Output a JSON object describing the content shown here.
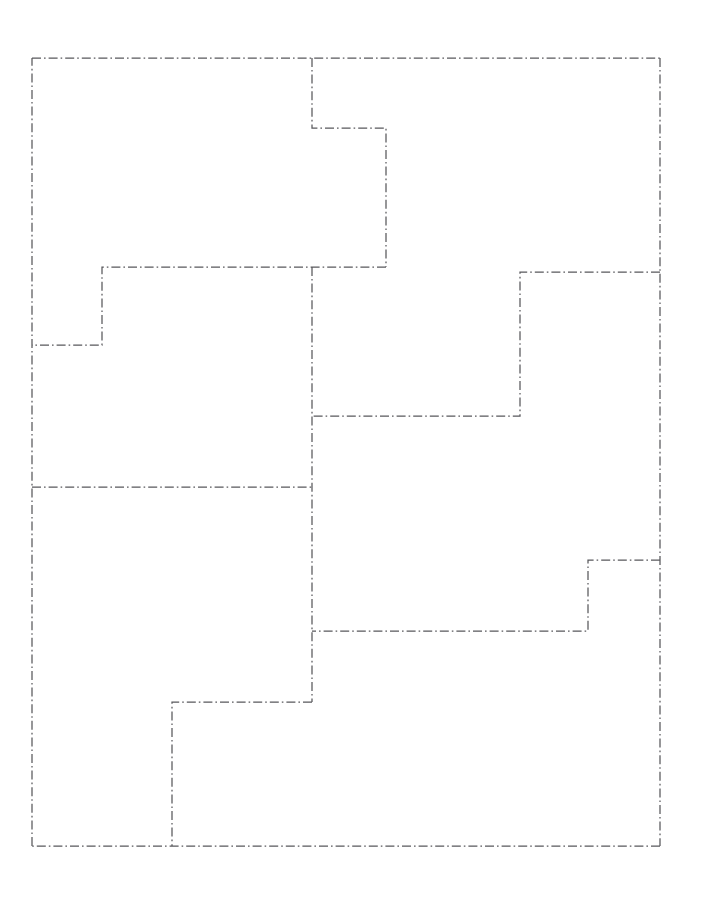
{
  "page": {
    "width": 702,
    "height": 898,
    "background_color": "#ffffff"
  },
  "style": {
    "line_color": "#58585c",
    "line_width": 1.25,
    "line_style": "dash-dot",
    "dash_pattern": "9 3 1.6 3"
  },
  "diagram": {
    "kind": "rectilinear-partition",
    "bounding_box": {
      "x": 32,
      "y": 58,
      "width": 628,
      "height": 788
    },
    "grid_lines_x": [
      32,
      102,
      172,
      312,
      386,
      520,
      588,
      660
    ],
    "grid_lines_y": [
      58,
      128,
      267,
      272,
      345,
      416,
      487,
      560,
      631,
      702,
      846
    ],
    "outline": "M 32 58 L 660 58 L 660 846 L 32 846 Z",
    "segments": [
      {
        "name": "outer-top-edge",
        "path": "M 32 58 L 660 58"
      },
      {
        "name": "outer-right-edge",
        "path": "M 660 58 L 660 846"
      },
      {
        "name": "outer-bottom-edge",
        "path": "M 660 846 L 32 846"
      },
      {
        "name": "outer-left-edge",
        "path": "M 32 846 L 32 58"
      },
      {
        "name": "divider-top-notch",
        "path": "M 312 58 L 312 128 L 386 128 L 386 267"
      },
      {
        "name": "divider-upper-left-step",
        "path": "M 386 267 L 102 267 L 102 345 L 32 345"
      },
      {
        "name": "divider-right-upper-step",
        "path": "M 660 272 L 520 272 L 520 416 L 312 416"
      },
      {
        "name": "divider-center-vertical",
        "path": "M 312 267 L 312 702"
      },
      {
        "name": "divider-mid-left",
        "path": "M 32 487 L 312 487"
      },
      {
        "name": "divider-right-lower-step",
        "path": "M 660 560 L 588 560 L 588 631 L 312 631"
      },
      {
        "name": "divider-bottom-left-step",
        "path": "M 312 702 L 172 702 L 172 846"
      }
    ],
    "regions": [
      {
        "name": "region-top-left",
        "label": "",
        "path": "M 32 58 L 312 58 L 312 267 L 102 267 L 102 345 L 32 345 Z"
      },
      {
        "name": "region-top-right",
        "label": "",
        "path": "M 312 58 L 660 58 L 660 272 L 520 272 L 520 416 L 312 416 L 312 267 L 386 267 L 386 128 L 312 128 Z"
      },
      {
        "name": "region-middle-left",
        "label": "",
        "path": "M 32 345 L 102 345 L 102 267 L 312 267 L 312 487 L 32 487 Z"
      },
      {
        "name": "region-right-middle",
        "label": "",
        "path": "M 312 416 L 520 416 L 520 272 L 660 272 L 660 560 L 588 560 L 588 631 L 312 631 Z"
      },
      {
        "name": "region-lower-left",
        "label": "",
        "path": "M 32 487 L 312 487 L 312 702 L 172 702 L 172 846 L 32 846 Z"
      },
      {
        "name": "region-bottom-right",
        "label": "",
        "path": "M 312 631 L 588 631 L 588 560 L 660 560 L 660 846 L 172 846 L 172 702 L 312 702 Z"
      }
    ]
  }
}
